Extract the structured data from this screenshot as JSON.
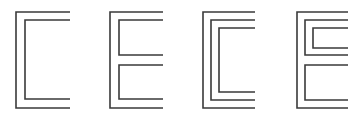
{
  "diagram": {
    "stroke_color": "#3a3a3a",
    "stroke_width": 1.6,
    "background": "#ffffff",
    "figures": [
      {
        "id": "fig-1",
        "label": "double-line C",
        "paths": [
          "70,12 16,12 16,108 70,108",
          "70,20 25,20 25,99 70,99"
        ]
      },
      {
        "id": "fig-2",
        "label": "double-line E",
        "paths": [
          "163,12 110,12 110,108 163,108",
          "163,20 119,20 119,55 163,55",
          "163,65 119,65 119,99 163,99"
        ]
      },
      {
        "id": "fig-3",
        "label": "triple-line C",
        "paths": [
          "255,12 203,12 203,108 255,108",
          "255,20 211,20 211,100 255,100",
          "255,28 219,28 219,92 255,92"
        ]
      },
      {
        "id": "fig-4",
        "label": "nested E",
        "paths": [
          "348,12 297,12 297,108 348,108",
          "348,20 305,20 305,55 348,55",
          "348,28 313,28 313,48 348,48",
          "348,65 305,65 305,100 348,100"
        ]
      }
    ]
  }
}
